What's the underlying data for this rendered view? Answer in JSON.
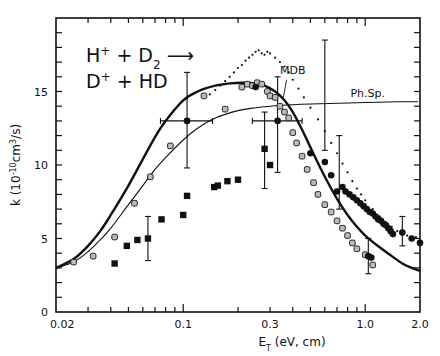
{
  "chart_data": {
    "type": "scatter",
    "title": "",
    "annotation": {
      "line1": "H⁺ + D₂ →",
      "line2": "D⁺ + HD"
    },
    "xlabel": "E_T (eV, cm)",
    "ylabel": "k (10^-10 cm^3/s)",
    "xscale": "log",
    "xlim": [
      0.02,
      2.0
    ],
    "ylim": [
      0,
      20
    ],
    "grid": false,
    "x_ticks": [
      {
        "value": 0.02,
        "label": "0.02"
      },
      {
        "value": 0.1,
        "label": "0.1"
      },
      {
        "value": 0.3,
        "label": "0.3"
      },
      {
        "value": 1.0,
        "label": "1.0"
      },
      {
        "value": 2.0,
        "label": "2.0"
      }
    ],
    "y_ticks": [
      {
        "value": 0,
        "label": "0"
      },
      {
        "value": 5,
        "label": "5"
      },
      {
        "value": 10,
        "label": "10"
      },
      {
        "value": 15,
        "label": "15"
      }
    ],
    "curve_labels": [
      {
        "text": "MDB",
        "x": 0.34,
        "y": 16.2
      },
      {
        "text": "Ph.Sp.",
        "x": 0.83,
        "y": 14.6
      }
    ],
    "series": [
      {
        "name": "MDB (thick solid)",
        "style": "thick-line",
        "x": [
          0.02,
          0.025,
          0.03,
          0.035,
          0.04,
          0.05,
          0.06,
          0.07,
          0.08,
          0.1,
          0.12,
          0.15,
          0.18,
          0.21,
          0.25,
          0.28,
          0.32,
          0.36,
          0.4,
          0.45,
          0.5,
          0.6,
          0.7,
          0.8,
          0.9,
          1.0,
          1.2,
          1.4,
          1.6,
          1.8,
          2.0
        ],
        "y": [
          3.0,
          3.6,
          4.5,
          5.5,
          6.6,
          8.6,
          10.4,
          11.9,
          13.0,
          14.4,
          15.0,
          15.4,
          15.55,
          15.6,
          15.55,
          15.4,
          15.0,
          14.4,
          13.6,
          12.4,
          11.2,
          9.2,
          7.7,
          6.6,
          5.8,
          5.2,
          4.4,
          3.8,
          3.3,
          3.0,
          2.8
        ]
      },
      {
        "name": "Ph.Sp. (thin solid)",
        "style": "thin-line",
        "x": [
          0.02,
          0.025,
          0.03,
          0.035,
          0.04,
          0.05,
          0.06,
          0.07,
          0.08,
          0.1,
          0.12,
          0.15,
          0.2,
          0.25,
          0.3,
          0.4,
          0.5,
          0.7,
          1.0,
          1.5,
          1.95
        ],
        "y": [
          3.0,
          3.4,
          4.1,
          4.9,
          5.7,
          7.3,
          8.6,
          9.7,
          10.5,
          11.7,
          12.5,
          13.2,
          13.7,
          13.9,
          14.0,
          14.1,
          14.15,
          14.2,
          14.25,
          14.3,
          14.3
        ]
      },
      {
        "name": "dotted curve",
        "style": "dots",
        "x": [
          0.14,
          0.15,
          0.16,
          0.17,
          0.18,
          0.19,
          0.2,
          0.21,
          0.22,
          0.23,
          0.24,
          0.25,
          0.26,
          0.27,
          0.28,
          0.29,
          0.3,
          0.32,
          0.34,
          0.36,
          0.38,
          0.4,
          0.43,
          0.46,
          0.5,
          0.55,
          0.6,
          0.65,
          0.7,
          0.75,
          0.8,
          0.85,
          0.9,
          0.95,
          1.0,
          1.1,
          1.2,
          1.3,
          1.4,
          1.5,
          1.6,
          1.7,
          1.8,
          1.9
        ],
        "y": [
          14.8,
          15.1,
          15.4,
          15.7,
          16.0,
          16.3,
          16.6,
          16.8,
          17.1,
          17.3,
          17.5,
          17.7,
          17.8,
          17.6,
          17.5,
          17.7,
          17.6,
          17.3,
          17.0,
          16.7,
          16.3,
          15.8,
          15.2,
          14.6,
          13.9,
          13.1,
          12.3,
          11.5,
          10.8,
          10.1,
          9.5,
          8.9,
          8.4,
          8.0,
          7.6,
          7.0,
          6.5,
          6.1,
          5.8,
          5.5,
          5.3,
          5.2,
          5.1,
          5.1
        ]
      },
      {
        "name": "open squares",
        "style": "open-square",
        "x": [
          0.025,
          0.032,
          0.042,
          0.054,
          0.066,
          0.085,
          0.13,
          0.17,
          0.21,
          0.225,
          0.24,
          0.255,
          0.27,
          0.29,
          0.3,
          0.32,
          0.34,
          0.36,
          0.38,
          0.4,
          0.42,
          0.45,
          0.48,
          0.52,
          0.55,
          0.6,
          0.65,
          0.7,
          0.75,
          0.8,
          0.85,
          0.9,
          1.0,
          1.1
        ],
        "y": [
          3.4,
          3.8,
          5.1,
          7.4,
          9.2,
          11.3,
          14.7,
          13.8,
          15.3,
          15.5,
          15.4,
          15.6,
          15.5,
          15.0,
          14.7,
          14.6,
          14.0,
          13.6,
          13.2,
          12.2,
          11.5,
          10.6,
          9.7,
          8.8,
          8.0,
          7.3,
          6.8,
          6.2,
          5.7,
          5.2,
          4.7,
          4.3,
          3.9,
          3.2
        ]
      },
      {
        "name": "filled squares",
        "style": "filled-square",
        "x": [
          0.042,
          0.049,
          0.056,
          0.064,
          0.076,
          0.1,
          0.105,
          0.148,
          0.155,
          0.175,
          0.2,
          0.28,
          0.3
        ],
        "y": [
          3.3,
          4.5,
          4.9,
          5.0,
          6.3,
          6.6,
          7.9,
          8.5,
          8.6,
          8.9,
          9.0,
          11.1,
          10.0
        ],
        "error_bars": [
          {
            "x": 0.064,
            "y": 5.0,
            "ylow": 3.5,
            "yhigh": 6.5
          }
        ]
      },
      {
        "name": "filled circles",
        "style": "filled-circle",
        "x": [
          0.105,
          0.25,
          0.33,
          0.5,
          0.6,
          0.65,
          0.7,
          0.75,
          0.78,
          0.82,
          0.86,
          0.9,
          0.94,
          0.98,
          1.02,
          1.06,
          1.1,
          1.14,
          1.18,
          1.22,
          1.26,
          1.3,
          1.34,
          1.38,
          1.42,
          1.04,
          1.08,
          1.6,
          1.8,
          2.0
        ],
        "y": [
          13.0,
          15.3,
          13.0,
          10.8,
          10.2,
          9.3,
          8.2,
          8.5,
          8.2,
          8.0,
          7.8,
          7.6,
          7.4,
          7.2,
          7.0,
          6.8,
          6.7,
          6.5,
          6.3,
          6.2,
          6.0,
          5.9,
          5.7,
          5.5,
          5.3,
          3.8,
          3.7,
          5.4,
          5.0,
          4.7
        ],
        "error_bars": [
          {
            "x": 0.105,
            "y": 13.0,
            "ylow": 9.8,
            "yhigh": 16.3,
            "xlow": 0.075,
            "xhigh": 0.145
          },
          {
            "x": 0.33,
            "y": 13.0,
            "ylow": 9.5,
            "yhigh": 16.0,
            "xlow": 0.24,
            "xhigh": 0.45
          },
          {
            "x": 0.6,
            "y": 14.0,
            "ylow": 11.0,
            "yhigh": 18.5
          },
          {
            "x": 0.72,
            "y": 9.5,
            "ylow": 7.0,
            "yhigh": 12.0
          },
          {
            "x": 1.04,
            "y": 3.8,
            "ylow": 2.6,
            "yhigh": 5.0
          },
          {
            "x": 1.6,
            "y": 5.4,
            "ylow": 4.5,
            "yhigh": 6.5
          },
          {
            "x": 0.28,
            "y": 10.5,
            "ylow": 8.4,
            "yhigh": 13.6
          }
        ]
      }
    ]
  },
  "colors": {
    "ink": "#111111",
    "background": "#ffffff",
    "open_marker_fill": "#bbbbbb"
  }
}
